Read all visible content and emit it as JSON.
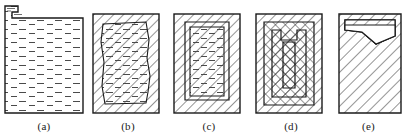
{
  "figure": {
    "width": 405,
    "height": 138,
    "background_color": "#ffffff",
    "line_color": "#1a1a1a",
    "hatch_color": "#2b2b2b",
    "liquid_color": "#4a4a4a",
    "panel_count": 5
  },
  "panels": [
    {
      "id": "a",
      "caption": "(a)",
      "name": "stage-a-fully-liquid",
      "description": "Mould cavity completely filled with liquid metal; pouring notch at upper left. No solidified shell yet.",
      "solid_fraction_percent": 0,
      "liquid_fraction_percent": 100,
      "has_pour_notch": true,
      "has_outer_hatched_wall": false,
      "shrinkage_void": "none",
      "body_x": 5,
      "body_y": 16,
      "body_w": 78,
      "body_h": 97
    },
    {
      "id": "b",
      "caption": "(b)",
      "name": "stage-b-thin-shell",
      "description": "A thin solidified shell has formed against the mould walls; the bulk of the casting remains liquid with an irregular solidification front.",
      "solid_fraction_percent": 25,
      "liquid_fraction_percent": 75,
      "has_pour_notch": false,
      "has_outer_hatched_wall": true,
      "wall_thickness_px": 12,
      "shrinkage_void": "none",
      "body_x": 92,
      "body_y": 14,
      "body_w": 66,
      "body_h": 99
    },
    {
      "id": "c",
      "caption": "(c)",
      "name": "stage-c-thick-shell",
      "description": "The solid shell has thickened; the remaining liquid forms a tall U-shaped pool open at the top.",
      "solid_fraction_percent": 50,
      "liquid_fraction_percent": 50,
      "has_pour_notch": false,
      "has_outer_hatched_wall": true,
      "wall_thickness_px": 18,
      "shrinkage_void": "none",
      "body_x": 174,
      "body_y": 14,
      "body_w": 66,
      "body_h": 99
    },
    {
      "id": "d",
      "caption": "(d)",
      "name": "stage-d-narrow-pool",
      "description": "Solidification fronts have nearly met; only a narrow V-shaped pipe of liquid remains in the centre, shown as nested layers.",
      "solid_fraction_percent": 80,
      "liquid_fraction_percent": 20,
      "has_pour_notch": false,
      "has_outer_hatched_wall": true,
      "wall_thickness_px": 14,
      "shrinkage_void": "narrow-central-pipe",
      "body_x": 256,
      "body_y": 14,
      "body_w": 66,
      "body_h": 99
    },
    {
      "id": "e",
      "caption": "(e)",
      "name": "stage-e-fully-solid",
      "description": "The casting is fully solid; a triangular shrinkage cavity (pipe) is left at the top of the casting.",
      "solid_fraction_percent": 100,
      "liquid_fraction_percent": 0,
      "has_pour_notch": false,
      "has_outer_hatched_wall": false,
      "shrinkage_void": "triangular-top-cavity",
      "body_x": 338,
      "body_y": 14,
      "body_w": 62,
      "body_h": 99
    }
  ]
}
